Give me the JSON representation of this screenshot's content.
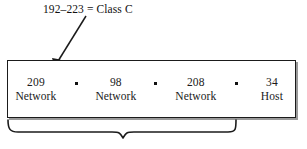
{
  "figure": {
    "annotation": {
      "text": "192–223 = Class C",
      "arrow_icon": "arrow-down-left-icon"
    },
    "address_box": {
      "separator_glyph": "•",
      "octets": [
        {
          "value": "209",
          "role": "Network"
        },
        {
          "value": "98",
          "role": "Network"
        },
        {
          "value": "208",
          "role": "Network"
        },
        {
          "value": "34",
          "role": "Host"
        }
      ]
    },
    "brace": {
      "icon": "curly-brace-icon",
      "caption": ""
    },
    "colors": {
      "ink": "#1a1a1a",
      "border": "#1b1b1b",
      "shadow": "#9a9a9a",
      "background": "#ffffff"
    }
  }
}
